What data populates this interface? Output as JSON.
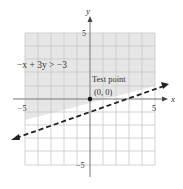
{
  "diagram": {
    "inequality_label": "−x + 3y > −3",
    "test_point_label": "Test point",
    "test_point_coords": "(0, 0)",
    "axis_x_label": "x",
    "axis_y_label": "y",
    "tick_x_neg": "−5",
    "tick_x_pos": "5",
    "tick_y_pos": "5",
    "tick_y_neg": "−5",
    "boundary_line": "y = (x - 3)/3",
    "boundary_style": "dashed",
    "shaded_region": "above line",
    "colors": {
      "shade": "#e6e6e6",
      "grid": "#c8c8c8",
      "axis": "#777777",
      "line": "#222222"
    }
  }
}
